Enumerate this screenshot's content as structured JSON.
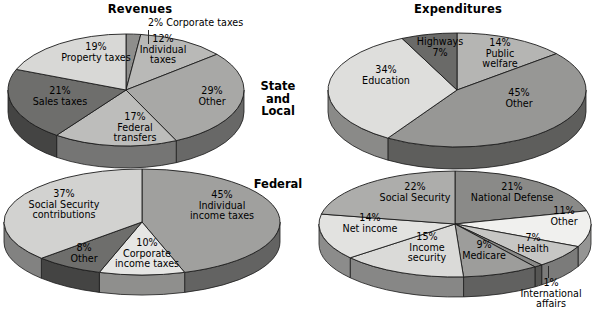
{
  "titles": {
    "left": "Revenues",
    "right": "Expenditures"
  },
  "row_labels": {
    "top": "State and Local",
    "top_line1": "State",
    "top_line2": "and",
    "top_line3": "Local",
    "bottom": "Federal"
  },
  "palette": {
    "bg": "#ffffff",
    "text": "#111111",
    "outline": "#1c1c1c",
    "gray_lightest": "#e8e8e6",
    "gray_lighter": "#d2d2d0",
    "gray_light": "#bdbdbb",
    "gray_mid": "#a3a3a1",
    "gray_mid2": "#8e8e8c",
    "gray_dark": "#767674",
    "gray_darker": "#5d5d5b",
    "gray_darkest": "#474745"
  },
  "chart_data": [
    {
      "type": "pie",
      "title": "Revenues",
      "group": "State and Local",
      "position": "top-left",
      "start_angle_deg": -90,
      "direction": "clockwise",
      "categories": [
        "Corporate taxes",
        "Individual taxes",
        "Other",
        "Federal transfers",
        "Sales taxes",
        "Property taxes"
      ],
      "values": [
        2,
        12,
        29,
        17,
        21,
        19
      ],
      "unit": "percent",
      "labels": [
        {
          "pct": "2%",
          "name": "Corporate taxes",
          "lines": [
            "2% Corporate taxes"
          ]
        },
        {
          "pct": "12%",
          "name": "Individual taxes",
          "lines": [
            "12%",
            "Individual",
            "taxes"
          ]
        },
        {
          "pct": "29%",
          "name": "Other",
          "lines": [
            "29%",
            "Other"
          ]
        },
        {
          "pct": "17%",
          "name": "Federal transfers",
          "lines": [
            "17%",
            "Federal",
            "transfers"
          ]
        },
        {
          "pct": "21%",
          "name": "Sales taxes",
          "lines": [
            "21%",
            "Sales taxes"
          ]
        },
        {
          "pct": "19%",
          "name": "Property taxes",
          "lines": [
            "19%",
            "Property taxes"
          ]
        }
      ],
      "slice_colors": [
        "#8e8e8c",
        "#b9b9b7",
        "#a8a8a6",
        "#bdbdbb",
        "#6e6e6c",
        "#d8d8d6"
      ]
    },
    {
      "type": "pie",
      "title": "Expenditures",
      "group": "State and Local",
      "position": "top-right",
      "start_angle_deg": -90,
      "direction": "clockwise",
      "categories": [
        "Public welfare",
        "Other",
        "Education",
        "Highways"
      ],
      "values": [
        14,
        45,
        34,
        7
      ],
      "unit": "percent",
      "labels": [
        {
          "pct": "14%",
          "name": "Public welfare",
          "lines": [
            "14%",
            "Public",
            "welfare"
          ]
        },
        {
          "pct": "45%",
          "name": "Other",
          "lines": [
            "45%",
            "Other"
          ]
        },
        {
          "pct": "34%",
          "name": "Education",
          "lines": [
            "34%",
            "Education"
          ]
        },
        {
          "pct": "7%",
          "name": "Highways",
          "lines": [
            "Highways",
            "7%"
          ]
        }
      ],
      "slice_colors": [
        "#b5b5b3",
        "#979795",
        "#dededc",
        "#6a6a68"
      ]
    },
    {
      "type": "pie",
      "title": "Revenues",
      "group": "Federal",
      "position": "bottom-left",
      "start_angle_deg": -90,
      "direction": "clockwise",
      "categories": [
        "Individual income taxes",
        "Corporate income taxes",
        "Other",
        "Social Security contributions"
      ],
      "values": [
        45,
        10,
        8,
        37
      ],
      "unit": "percent",
      "labels": [
        {
          "pct": "45%",
          "name": "Individual income taxes",
          "lines": [
            "45%",
            "Individual",
            "income taxes"
          ]
        },
        {
          "pct": "10%",
          "name": "Corporate income taxes",
          "lines": [
            "10%",
            "Corporate",
            "income taxes"
          ]
        },
        {
          "pct": "8%",
          "name": "Other",
          "lines": [
            "8%",
            "Other"
          ]
        },
        {
          "pct": "37%",
          "name": "Social Security contributions",
          "lines": [
            "37%",
            "Social Security",
            "contributions"
          ]
        }
      ],
      "slice_colors": [
        "#a0a09e",
        "#e6e6e4",
        "#6e6e6c",
        "#d2d2d0"
      ]
    },
    {
      "type": "pie",
      "title": "Expenditures",
      "group": "Federal",
      "position": "bottom-right",
      "start_angle_deg": -90,
      "direction": "clockwise",
      "categories": [
        "National Defense",
        "Other",
        "Health",
        "International affairs",
        "Medicare",
        "Income security",
        "Net income",
        "Social Security"
      ],
      "values": [
        21,
        11,
        7,
        1,
        9,
        15,
        14,
        22
      ],
      "unit": "percent",
      "labels": [
        {
          "pct": "21%",
          "name": "National Defense",
          "lines": [
            "21%",
            "National Defense"
          ]
        },
        {
          "pct": "11%",
          "name": "Other",
          "lines": [
            "11%",
            "Other"
          ]
        },
        {
          "pct": "7%",
          "name": "Health",
          "lines": [
            "7%",
            "Health"
          ]
        },
        {
          "pct": "1%",
          "name": "International affairs",
          "lines": [
            "1%",
            "International",
            "affairs"
          ]
        },
        {
          "pct": "9%",
          "name": "Medicare",
          "lines": [
            "9%",
            "Medicare"
          ]
        },
        {
          "pct": "15%",
          "name": "Income security",
          "lines": [
            "15%",
            "Income",
            "security"
          ]
        },
        {
          "pct": "14%",
          "name": "Net income",
          "lines": [
            "14%",
            "Net income"
          ]
        },
        {
          "pct": "22%",
          "name": "Social Security",
          "lines": [
            "22%",
            "Social Security"
          ]
        }
      ],
      "slice_colors": [
        "#8a8a88",
        "#f0f0ee",
        "#c6c6c4",
        "#8a8a88",
        "#9d9d9b",
        "#dadad8",
        "#e2e2e0",
        "#adadab"
      ]
    }
  ],
  "pie_labels": {
    "tl_corporate": "2% Corporate taxes",
    "tl_individual_1": "12%",
    "tl_individual_2": "Individual",
    "tl_individual_3": "taxes",
    "tl_other_1": "29%",
    "tl_other_2": "Other",
    "tl_federal_1": "17%",
    "tl_federal_2": "Federal",
    "tl_federal_3": "transfers",
    "tl_sales_1": "21%",
    "tl_sales_2": "Sales taxes",
    "tl_property_1": "19%",
    "tl_property_2": "Property taxes",
    "tr_public_1": "14%",
    "tr_public_2": "Public",
    "tr_public_3": "welfare",
    "tr_other_1": "45%",
    "tr_other_2": "Other",
    "tr_education_1": "34%",
    "tr_education_2": "Education",
    "tr_highways_1": "Highways",
    "tr_highways_2": "7%",
    "bl_individual_1": "45%",
    "bl_individual_2": "Individual",
    "bl_individual_3": "income taxes",
    "bl_corporate_1": "10%",
    "bl_corporate_2": "Corporate",
    "bl_corporate_3": "income taxes",
    "bl_other_1": "8%",
    "bl_other_2": "Other",
    "bl_ssc_1": "37%",
    "bl_ssc_2": "Social Security",
    "bl_ssc_3": "contributions",
    "br_defense_1": "21%",
    "br_defense_2": "National Defense",
    "br_other_1": "11%",
    "br_other_2": "Other",
    "br_health_1": "7%",
    "br_health_2": "Health",
    "br_intl_1": "1%",
    "br_intl_2": "International",
    "br_intl_3": "affairs",
    "br_medicare_1": "9%",
    "br_medicare_2": "Medicare",
    "br_incsec_1": "15%",
    "br_incsec_2": "Income",
    "br_incsec_3": "security",
    "br_netinc_1": "14%",
    "br_netinc_2": "Net income",
    "br_ss_1": "22%",
    "br_ss_2": "Social Security"
  }
}
